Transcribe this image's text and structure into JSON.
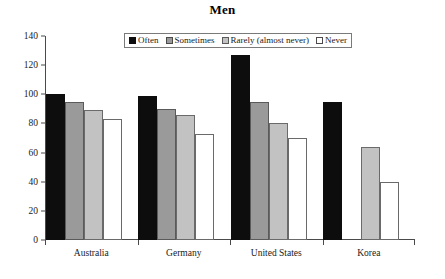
{
  "chart_data": {
    "type": "bar",
    "title": "Men",
    "xlabel": "",
    "ylabel": "",
    "ylim": [
      0,
      140
    ],
    "yticks": [
      0,
      20,
      40,
      60,
      80,
      100,
      120,
      140
    ],
    "grid": false,
    "legend_position": "top-center",
    "categories": [
      "Australia",
      "Germany",
      "United States",
      "Korea"
    ],
    "series": [
      {
        "name": "Often",
        "color": "#0d0d0d",
        "values": [
          100,
          99,
          127,
          95
        ]
      },
      {
        "name": "Sometimes",
        "color": "#9a9a9a",
        "values": [
          95,
          90,
          95,
          null
        ]
      },
      {
        "name": "Rarely (almost never)",
        "color": "#c2c2c2",
        "values": [
          89,
          86,
          80,
          64
        ]
      },
      {
        "name": "Never",
        "color": "#ffffff",
        "values": [
          83,
          73,
          70,
          40
        ]
      }
    ]
  },
  "axes": {
    "y_tick_labels": [
      "0",
      "20",
      "40",
      "60",
      "80",
      "100",
      "120",
      "140"
    ]
  },
  "legend": {
    "items": [
      {
        "label": "Often",
        "swatch": "s-often"
      },
      {
        "label": "Sometimes",
        "swatch": "s-sometimes"
      },
      {
        "label": "Rarely (almost never)",
        "swatch": "s-rarely"
      },
      {
        "label": "Never",
        "swatch": "s-never"
      }
    ]
  }
}
